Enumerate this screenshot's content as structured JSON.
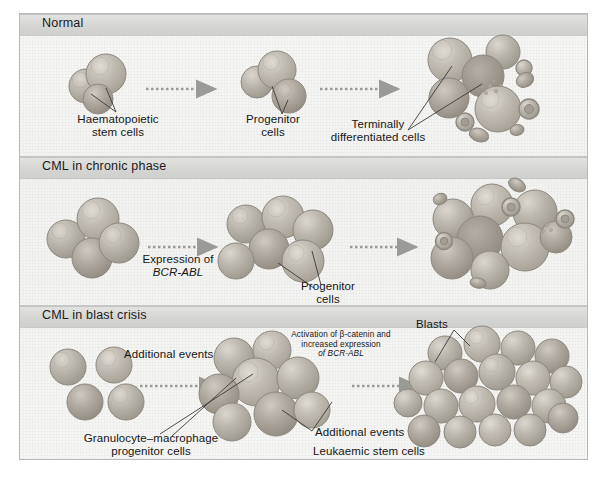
{
  "figure": {
    "type": "biomedical-schematic",
    "panels": [
      {
        "id": "normal",
        "title": "Normal",
        "labels": [
          {
            "id": "hsc",
            "text_line1": "Haematopoietic",
            "text_line2": "stem cells"
          },
          {
            "id": "progenitor",
            "text_line1": "Progenitor",
            "text_line2": "cells"
          },
          {
            "id": "terminal",
            "text_line1": "Terminally",
            "text_line2": "differentiated cells"
          }
        ],
        "arrows": 2
      },
      {
        "id": "chronic",
        "title": "CML in chronic phase",
        "labels": [
          {
            "id": "expression",
            "text_line1": "Expression of",
            "text_line2": "BCR-ABL",
            "line2_italic": true
          },
          {
            "id": "progenitor",
            "text_line1": "Progenitor",
            "text_line2": "cells"
          }
        ],
        "arrows": 2
      },
      {
        "id": "blast",
        "title": "CML in blast crisis",
        "labels": [
          {
            "id": "additional-events-top",
            "text_line1": "Additional events"
          },
          {
            "id": "activation",
            "text_line1": "Activation of β-catenin and",
            "text_line2": "increased expression",
            "text_line3": "of BCR-ABL",
            "line3_italic": true
          },
          {
            "id": "blasts",
            "text_line1": "Blasts"
          },
          {
            "id": "gmp",
            "text_line1": "Granulocyte–macrophage",
            "text_line2": "progenitor cells"
          },
          {
            "id": "additional-events-bottom",
            "text_line1": "Additional events"
          },
          {
            "id": "lsc",
            "text_line1": "Leukaemic stem cells"
          }
        ],
        "arrows": 2
      }
    ],
    "colors": {
      "paper": "#f4f4f2",
      "header_band": "#d5d5d3",
      "cell_fill": "#b9b4ac",
      "cell_stroke": "#8d8880",
      "arrow": "#9a9a96",
      "leader_line": "#3a3a3a",
      "text": "#161616",
      "frame": "#b9b9b9"
    }
  }
}
